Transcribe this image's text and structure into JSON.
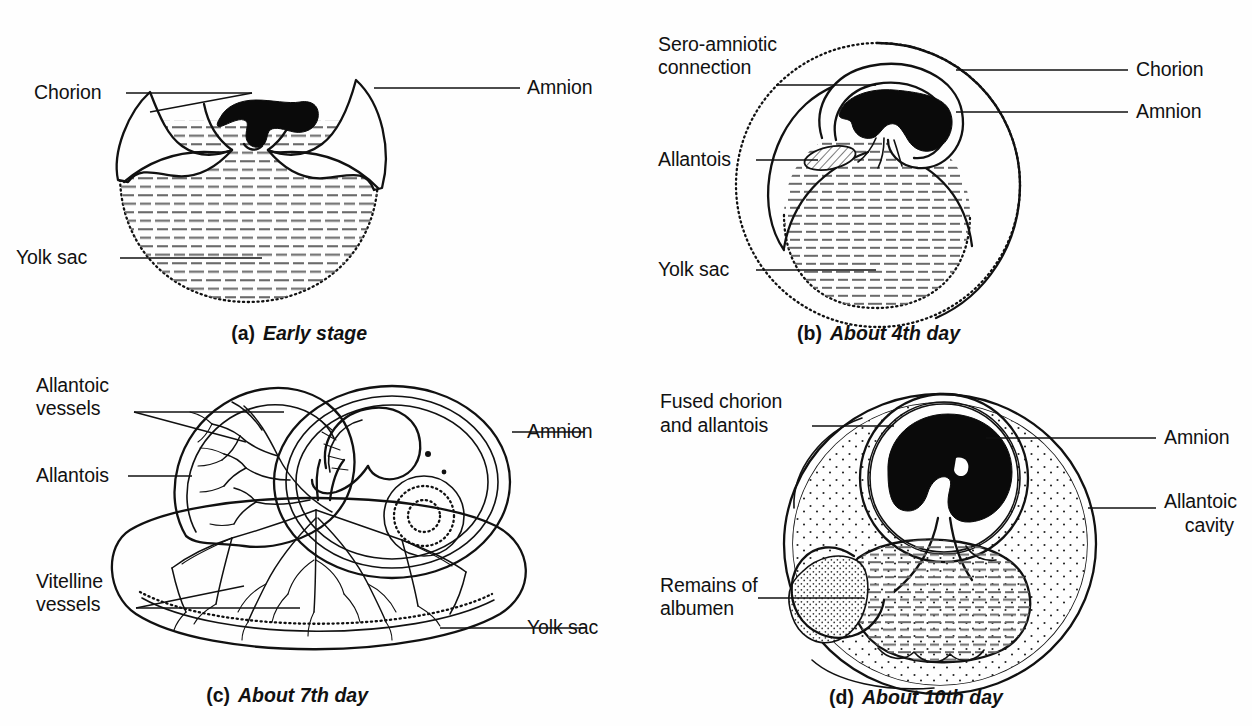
{
  "figure": {
    "background_color": "#fefefe",
    "ink_color": "#111111",
    "embryo_color": "#0a0a0a"
  },
  "panels": [
    {
      "id": "a",
      "caption_index": "(a)",
      "caption_text": "Early stage",
      "labels": [
        {
          "name": "chorion",
          "text": "Chorion",
          "side": "left"
        },
        {
          "name": "yolk-sac",
          "text": "Yolk sac",
          "side": "left"
        },
        {
          "name": "amnion",
          "text": "Amnion",
          "side": "right"
        }
      ]
    },
    {
      "id": "b",
      "caption_index": "(b)",
      "caption_text": "About 4th day",
      "labels": [
        {
          "name": "sero-amniotic-connection",
          "text": "Sero-amniotic",
          "text2": "connection",
          "side": "left"
        },
        {
          "name": "allantois",
          "text": "Allantois",
          "side": "left"
        },
        {
          "name": "yolk-sac",
          "text": "Yolk sac",
          "side": "left"
        },
        {
          "name": "chorion",
          "text": "Chorion",
          "side": "right"
        },
        {
          "name": "amnion",
          "text": "Amnion",
          "side": "right"
        }
      ]
    },
    {
      "id": "c",
      "caption_index": "(c)",
      "caption_text": "About 7th day",
      "labels": [
        {
          "name": "allantoic-vessels",
          "text": "Allantoic",
          "text2": "vessels",
          "side": "left"
        },
        {
          "name": "allantois",
          "text": "Allantois",
          "side": "left"
        },
        {
          "name": "vitelline-vessels",
          "text": "Vitelline",
          "text2": "vessels",
          "side": "left"
        },
        {
          "name": "amnion",
          "text": "Amnion",
          "side": "right"
        },
        {
          "name": "yolk-sac",
          "text": "Yolk sac",
          "side": "right"
        }
      ]
    },
    {
      "id": "d",
      "caption_index": "(d)",
      "caption_text": "About 10th day",
      "labels": [
        {
          "name": "fused-chorion-and-allantois",
          "text": "Fused chorion",
          "text2": "and allantois",
          "side": "left"
        },
        {
          "name": "remains-of-albumen",
          "text": "Remains of",
          "text2": "albumen",
          "side": "left"
        },
        {
          "name": "amnion",
          "text": "Amnion",
          "side": "right"
        },
        {
          "name": "allantoic-cavity",
          "text": "Allantoic",
          "text2": "cavity",
          "side": "right"
        }
      ]
    }
  ]
}
